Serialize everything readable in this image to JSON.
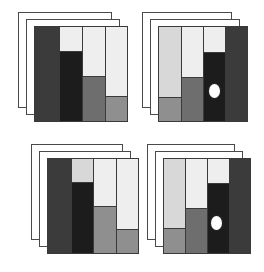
{
  "figure": {
    "background_color": "#ffffff",
    "width": 264,
    "height": 272,
    "outline_color": "#3a3a3a",
    "sheet_outline_color": "#4a4a4a"
  },
  "palette": {
    "dark": "#3b3b3b",
    "black": "#1c1c1c",
    "mid": "#6e6e6e",
    "mid_light": "#8f8f8f",
    "light": "#d8d8d8",
    "pale": "#eeeeee",
    "white": "#ffffff"
  },
  "panels": [
    {
      "id": "panel-top-left",
      "label": "Top left mosaic",
      "x": 34,
      "y": 26,
      "width": 94,
      "height": 96,
      "sheets": [
        {
          "dx": -16,
          "dy": -14
        },
        {
          "dx": -8,
          "dy": -7
        }
      ],
      "marker": null,
      "columns": [
        {
          "name": "column-1",
          "x": 0,
          "width": 25,
          "segments": [
            {
              "name": "segment-1-1",
              "top": 0,
              "height": 100,
              "color": "#3b3b3b",
              "tone": "dark"
            }
          ]
        },
        {
          "name": "column-2",
          "x": 25,
          "width": 23,
          "segments": [
            {
              "name": "segment-2-1",
              "top": 0,
              "height": 25,
              "color": "#eeeeee",
              "tone": "pale"
            },
            {
              "name": "segment-2-2",
              "top": 25,
              "height": 75,
              "color": "#1c1c1c",
              "tone": "black"
            }
          ]
        },
        {
          "name": "column-3",
          "x": 48,
          "width": 23,
          "segments": [
            {
              "name": "segment-3-1",
              "top": 0,
              "height": 52,
              "color": "#eeeeee",
              "tone": "pale"
            },
            {
              "name": "segment-3-2",
              "top": 52,
              "height": 48,
              "color": "#6e6e6e",
              "tone": "mid"
            }
          ]
        },
        {
          "name": "column-4",
          "x": 71,
          "width": 23,
          "segments": [
            {
              "name": "segment-4-1",
              "top": 0,
              "height": 73,
              "color": "#eeeeee",
              "tone": "pale"
            },
            {
              "name": "segment-4-2",
              "top": 73,
              "height": 27,
              "color": "#8f8f8f",
              "tone": "mid_light"
            }
          ]
        }
      ]
    },
    {
      "id": "panel-top-right",
      "label": "Top right mosaic",
      "x": 158,
      "y": 26,
      "width": 90,
      "height": 96,
      "sheets": [
        {
          "dx": -16,
          "dy": -14
        },
        {
          "dx": -8,
          "dy": -7
        }
      ],
      "marker": {
        "name": "ellipse-marker",
        "cx": 55,
        "cy": 64,
        "rx": 5.5,
        "ry": 7
      },
      "columns": [
        {
          "name": "column-1",
          "x": 0,
          "width": 23,
          "segments": [
            {
              "name": "segment-1-1",
              "top": 0,
              "height": 74,
              "color": "#d8d8d8",
              "tone": "light"
            },
            {
              "name": "segment-1-2",
              "top": 74,
              "height": 26,
              "color": "#8f8f8f",
              "tone": "mid_light"
            }
          ]
        },
        {
          "name": "column-2",
          "x": 23,
          "width": 22,
          "segments": [
            {
              "name": "segment-2-1",
              "top": 0,
              "height": 53,
              "color": "#eeeeee",
              "tone": "pale"
            },
            {
              "name": "segment-2-2",
              "top": 53,
              "height": 47,
              "color": "#6e6e6e",
              "tone": "mid"
            }
          ]
        },
        {
          "name": "column-3",
          "x": 45,
          "width": 22,
          "segments": [
            {
              "name": "segment-3-1",
              "top": 0,
              "height": 27,
              "color": "#eeeeee",
              "tone": "pale"
            },
            {
              "name": "segment-3-2",
              "top": 27,
              "height": 73,
              "color": "#1c1c1c",
              "tone": "black"
            }
          ]
        },
        {
          "name": "column-4",
          "x": 67,
          "width": 23,
          "segments": [
            {
              "name": "segment-4-1",
              "top": 0,
              "height": 100,
              "color": "#3b3b3b",
              "tone": "dark"
            }
          ]
        }
      ]
    },
    {
      "id": "panel-bottom-left",
      "label": "Bottom left mosaic",
      "x": 47,
      "y": 158,
      "width": 92,
      "height": 96,
      "sheets": [
        {
          "dx": -16,
          "dy": -14
        },
        {
          "dx": -8,
          "dy": -7
        }
      ],
      "marker": null,
      "columns": [
        {
          "name": "column-1",
          "x": 0,
          "width": 24,
          "segments": [
            {
              "name": "segment-1-1",
              "top": 0,
              "height": 100,
              "color": "#3b3b3b",
              "tone": "dark"
            }
          ]
        },
        {
          "name": "column-2",
          "x": 24,
          "width": 22,
          "segments": [
            {
              "name": "segment-2-1",
              "top": 0,
              "height": 24,
              "color": "#d8d8d8",
              "tone": "light"
            },
            {
              "name": "segment-2-2",
              "top": 24,
              "height": 76,
              "color": "#1c1c1c",
              "tone": "black"
            }
          ]
        },
        {
          "name": "column-3",
          "x": 46,
          "width": 23,
          "segments": [
            {
              "name": "segment-3-1",
              "top": 0,
              "height": 50,
              "color": "#eeeeee",
              "tone": "pale"
            },
            {
              "name": "segment-3-2",
              "top": 50,
              "height": 50,
              "color": "#8f8f8f",
              "tone": "mid_light"
            }
          ]
        },
        {
          "name": "column-4",
          "x": 69,
          "width": 23,
          "segments": [
            {
              "name": "segment-4-1",
              "top": 0,
              "height": 74,
              "color": "#eeeeee",
              "tone": "pale"
            },
            {
              "name": "segment-4-2",
              "top": 74,
              "height": 26,
              "color": "#8f8f8f",
              "tone": "mid_light"
            }
          ]
        }
      ]
    },
    {
      "id": "panel-bottom-right",
      "label": "Bottom right mosaic",
      "x": 163,
      "y": 158,
      "width": 88,
      "height": 96,
      "sheets": [
        {
          "dx": -16,
          "dy": -14
        },
        {
          "dx": -8,
          "dy": -7
        }
      ],
      "marker": {
        "name": "ellipse-marker",
        "cx": 52,
        "cy": 64,
        "rx": 5.5,
        "ry": 7
      },
      "columns": [
        {
          "name": "column-1",
          "x": 0,
          "width": 22,
          "segments": [
            {
              "name": "segment-1-1",
              "top": 0,
              "height": 73,
              "color": "#d8d8d8",
              "tone": "light"
            },
            {
              "name": "segment-1-2",
              "top": 73,
              "height": 27,
              "color": "#8f8f8f",
              "tone": "mid_light"
            }
          ]
        },
        {
          "name": "column-2",
          "x": 22,
          "width": 22,
          "segments": [
            {
              "name": "segment-2-1",
              "top": 0,
              "height": 52,
              "color": "#eeeeee",
              "tone": "pale"
            },
            {
              "name": "segment-2-2",
              "top": 52,
              "height": 48,
              "color": "#6e6e6e",
              "tone": "mid"
            }
          ]
        },
        {
          "name": "column-3",
          "x": 44,
          "width": 22,
          "segments": [
            {
              "name": "segment-3-1",
              "top": 0,
              "height": 26,
              "color": "#eeeeee",
              "tone": "pale"
            },
            {
              "name": "segment-3-2",
              "top": 26,
              "height": 74,
              "color": "#1c1c1c",
              "tone": "black"
            }
          ]
        },
        {
          "name": "column-4",
          "x": 66,
          "width": 22,
          "segments": [
            {
              "name": "segment-4-1",
              "top": 0,
              "height": 100,
              "color": "#3b3b3b",
              "tone": "dark"
            }
          ]
        }
      ]
    }
  ]
}
